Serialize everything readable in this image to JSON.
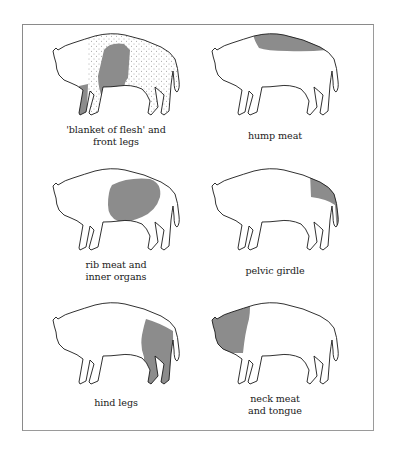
{
  "figure": {
    "colors": {
      "outline": "#1a1a1a",
      "shade": "#8c8c8c",
      "stipple": "#555555",
      "frame": "#8a8a8a",
      "background": "#ffffff"
    },
    "panels": [
      {
        "id": "blanket-of-flesh",
        "caption_lines": [
          "'blanket of flesh' and",
          "front legs"
        ],
        "highlight": "blanket-and-front-legs"
      },
      {
        "id": "hump-meat",
        "caption_lines": [
          "hump meat"
        ],
        "highlight": "hump"
      },
      {
        "id": "rib-meat",
        "caption_lines": [
          "rib meat and",
          "inner organs"
        ],
        "highlight": "ribs"
      },
      {
        "id": "pelvic-girdle",
        "caption_lines": [
          "pelvic girdle"
        ],
        "highlight": "pelvis"
      },
      {
        "id": "hind-legs",
        "caption_lines": [
          "hind legs"
        ],
        "highlight": "hind-legs"
      },
      {
        "id": "neck-meat",
        "caption_lines": [
          "neck meat",
          "and tongue"
        ],
        "highlight": "neck"
      }
    ]
  }
}
